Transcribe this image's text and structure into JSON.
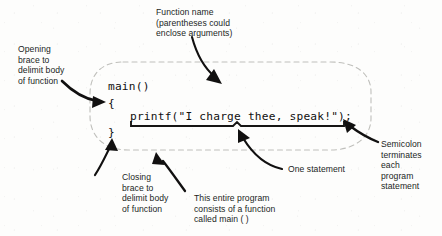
{
  "diagram": {
    "code": {
      "lines": [
        {
          "id": "function-header",
          "text": "main()"
        },
        {
          "id": "opening-brace",
          "text": "{"
        },
        {
          "id": "printf-statement",
          "text": "printf(\"I charge thee, speak!\");"
        },
        {
          "id": "closing-brace",
          "text": "}"
        }
      ]
    },
    "annotations": [
      {
        "id": "function-name",
        "text": "Function name\n(parentheses could\nenclose arguments)"
      },
      {
        "id": "opening-brace-note",
        "text": "Opening\nbrace to\ndelimit body\nof function"
      },
      {
        "id": "semicolon-note",
        "text": "Semicolon\nterminates\neach\nprogram\nstatement"
      },
      {
        "id": "one-statement-note",
        "text": "One statement"
      },
      {
        "id": "closing-brace-note",
        "text": "Closing\nbrace to\ndelimit body\nof function"
      },
      {
        "id": "entire-program-note",
        "text": "This entire program\nconsists of a function\ncalled main ( )"
      }
    ],
    "colors": {
      "ink": "#221f1d",
      "code_ink": "#111010",
      "dashed_outline": "#b8b8b4",
      "page": "#fdfdfc"
    }
  }
}
